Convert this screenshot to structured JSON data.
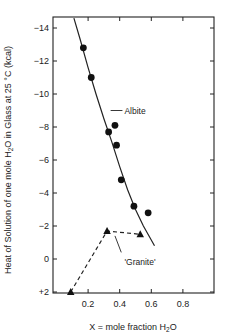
{
  "chart_data": {
    "type": "scatter",
    "title": "",
    "xlabel": "X = mole fraction H2O",
    "xlabel_main": "X = mole fraction H",
    "xlabel_sub": "2",
    "xlabel_tail": "O",
    "ylabel": "Heat of Solution of one mole H2O in Glass at 25 °C (kcal)",
    "ylabel_main": "Heat of Solution of one mole H",
    "ylabel_sub": "2",
    "ylabel_tail": "O in Glass at 25 °C (kcal)",
    "xlim": [
      0,
      1.0
    ],
    "ylim": [
      2,
      -14.6
    ],
    "y_inverted": true,
    "grid": false,
    "x_ticks": [
      0.2,
      0.4,
      0.6,
      0.8
    ],
    "x_tick_labels": [
      "0.2",
      "0.4",
      "0.6",
      "0.8"
    ],
    "y_ticks": [
      -14,
      -12,
      -10,
      -8,
      -6,
      -4,
      -2,
      0,
      2
    ],
    "y_tick_labels": [
      "-14",
      "-12",
      "-10",
      "-8",
      "-6",
      "-4",
      "-2",
      "0",
      "+2"
    ],
    "series": [
      {
        "name": "Albite",
        "marker": "circle",
        "points": [
          [
            0.17,
            -12.8
          ],
          [
            0.22,
            -11.0
          ],
          [
            0.33,
            -7.7
          ],
          [
            0.37,
            -8.1
          ],
          [
            0.38,
            -6.9
          ],
          [
            0.41,
            -4.8
          ],
          [
            0.49,
            -3.2
          ],
          [
            0.58,
            -2.8
          ]
        ],
        "fit_curve": [
          [
            0.11,
            -14.6
          ],
          [
            0.15,
            -13.3
          ],
          [
            0.2,
            -11.6
          ],
          [
            0.25,
            -10.0
          ],
          [
            0.3,
            -8.5
          ],
          [
            0.35,
            -7.1
          ],
          [
            0.4,
            -5.6
          ],
          [
            0.45,
            -4.2
          ],
          [
            0.5,
            -3.0
          ],
          [
            0.55,
            -2.0
          ],
          [
            0.62,
            -0.8
          ]
        ],
        "line_style": "solid"
      },
      {
        "name": "'Granite'",
        "marker": "triangle",
        "points": [
          [
            0.09,
            2.0
          ],
          [
            0.32,
            -1.7
          ],
          [
            0.53,
            -1.5
          ]
        ],
        "line_style": "dashed"
      }
    ],
    "annotations": [
      {
        "text": "Albite",
        "x": 0.43,
        "y": -9.0,
        "leader_from": [
          0.33,
          -9.0
        ]
      },
      {
        "text": "'Granite'",
        "x": 0.43,
        "y": 0.2,
        "leader_from": [
          0.37,
          -1.4
        ]
      }
    ]
  }
}
